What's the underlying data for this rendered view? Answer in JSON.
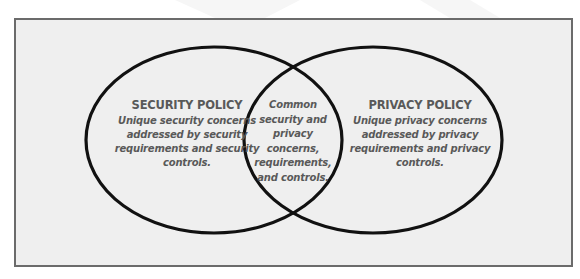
{
  "diagram": {
    "type": "venn",
    "colors": {
      "frame_border": "#6b6b6b",
      "frame_background": "#efefef",
      "circle_stroke": "#111111",
      "text": "#595959"
    },
    "left_set": {
      "title": "SECURITY POLICY",
      "description": "Unique security concerns addressed by security requirements and security controls.",
      "lines": [
        "Unique security concerns",
        "addressed by security",
        "requirements and security",
        "controls."
      ]
    },
    "right_set": {
      "title": "PRIVACY POLICY",
      "description": "Unique privacy concerns addressed by privacy requirements and privacy controls.",
      "lines": [
        "Unique privacy concerns",
        "addressed by privacy",
        "requirements and privacy",
        "controls."
      ]
    },
    "intersection": {
      "description": "Common security and privacy concerns, requirements, and controls.",
      "lines": [
        "Common",
        "security and",
        "privacy",
        "concerns,",
        "requirements,",
        "and controls."
      ]
    }
  }
}
